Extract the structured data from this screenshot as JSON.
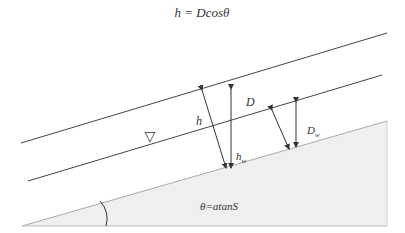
{
  "title": "h = Dcosθ",
  "labels": {
    "D": "D",
    "h": "h",
    "Dw": "D",
    "Dw_sub": "w",
    "hw": "h",
    "hw_sub": "w",
    "theta_eq": "θ=atanS",
    "water_table": "▽"
  },
  "colors": {
    "line": "#444444",
    "ground_fill": "#efefef",
    "ground_edge": "#bbbbbb",
    "text": "#333333"
  }
}
